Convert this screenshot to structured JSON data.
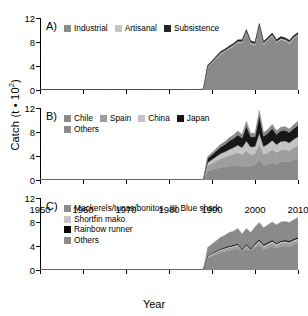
{
  "chart_data": {
    "type": "area",
    "title": "",
    "xlabel": "Year",
    "ylabel": "Catch (t • 10²)",
    "ylabel_base": "Catch (t • 10",
    "ylabel_exp": "2",
    "ylabel_tail": ")",
    "xlim": [
      1950,
      2010
    ],
    "ylim": [
      0,
      12
    ],
    "xticks": [
      1950,
      1960,
      1970,
      1980,
      1990,
      2000,
      2010
    ],
    "yticks": [
      0,
      4,
      8,
      12
    ],
    "grid": false,
    "legend_position": "inside-top-left",
    "stacked": true,
    "x": [
      1950,
      1951,
      1952,
      1953,
      1954,
      1955,
      1956,
      1957,
      1958,
      1959,
      1960,
      1961,
      1962,
      1963,
      1964,
      1965,
      1966,
      1967,
      1968,
      1969,
      1970,
      1971,
      1972,
      1973,
      1974,
      1975,
      1976,
      1977,
      1978,
      1979,
      1980,
      1981,
      1982,
      1983,
      1984,
      1985,
      1986,
      1987,
      1988,
      1989,
      1990,
      1991,
      1992,
      1993,
      1994,
      1995,
      1996,
      1997,
      1998,
      1999,
      2000,
      2001,
      2002,
      2003,
      2004,
      2005,
      2006,
      2007,
      2008,
      2009,
      2010
    ],
    "panels": [
      {
        "id": "A",
        "label": "A)",
        "legend_rows": [
          [
            {
              "name": "Industrial",
              "color": "#8a8a8a"
            },
            {
              "name": "Artisanal",
              "color": "#c4c4c4"
            },
            {
              "name": "Subsistence",
              "color": "#262626"
            }
          ]
        ],
        "series": [
          {
            "name": "Industrial",
            "color": "#8a8a8a",
            "values": [
              0,
              0,
              0,
              0,
              0,
              0,
              0,
              0,
              0,
              0,
              0,
              0,
              0,
              0,
              0,
              0,
              0,
              0,
              0,
              0,
              0,
              0,
              0,
              0,
              0,
              0,
              0,
              0,
              0,
              0,
              0,
              0,
              0,
              0,
              0,
              0,
              0,
              0,
              0.05,
              3.9,
              4.5,
              5.3,
              6.0,
              6.4,
              6.9,
              7.3,
              7.9,
              7.9,
              9.6,
              7.7,
              7.5,
              10.6,
              7.6,
              8.3,
              9.0,
              7.9,
              8.4,
              8.2,
              7.8,
              8.6,
              9.1
            ]
          },
          {
            "name": "Artisanal",
            "color": "#c4c4c4",
            "values": [
              0,
              0,
              0,
              0,
              0,
              0,
              0,
              0,
              0,
              0,
              0,
              0,
              0,
              0,
              0,
              0,
              0,
              0,
              0,
              0,
              0,
              0,
              0,
              0,
              0,
              0,
              0,
              0,
              0.04,
              0.05,
              0.05,
              0.06,
              0.06,
              0.07,
              0.07,
              0.08,
              0.08,
              0.09,
              0.09,
              0.12,
              0.14,
              0.15,
              0.16,
              0.17,
              0.18,
              0.19,
              0.2,
              0.2,
              0.2,
              0.2,
              0.2,
              0.2,
              0.2,
              0.2,
              0.2,
              0.2,
              0.2,
              0.2,
              0.2,
              0.2,
              0.2
            ]
          },
          {
            "name": "Subsistence",
            "color": "#262626",
            "values": [
              0,
              0,
              0,
              0,
              0,
              0,
              0,
              0,
              0,
              0,
              0,
              0,
              0,
              0,
              0,
              0,
              0,
              0,
              0,
              0,
              0,
              0,
              0,
              0,
              0,
              0,
              0,
              0,
              0,
              0,
              0,
              0,
              0,
              0,
              0,
              0,
              0,
              0,
              0,
              0.15,
              0.2,
              0.22,
              0.24,
              0.25,
              0.26,
              0.27,
              0.28,
              0.28,
              0.3,
              0.3,
              0.3,
              0.3,
              0.3,
              0.3,
              0.3,
              0.3,
              0.3,
              0.3,
              0.3,
              0.3,
              0.3
            ]
          }
        ]
      },
      {
        "id": "B",
        "label": "B)",
        "legend_rows": [
          [
            {
              "name": "Chile",
              "color": "#8a8a8a"
            },
            {
              "name": "Spain",
              "color": "#9e9e9e"
            },
            {
              "name": "China",
              "color": "#c4c4c4"
            },
            {
              "name": "Japan",
              "color": "#171717"
            }
          ],
          [
            {
              "name": "Others",
              "color": "#8a8a8a"
            }
          ]
        ],
        "series": [
          {
            "name": "Chile",
            "color": "#8a8a8a",
            "values": [
              0,
              0,
              0,
              0,
              0,
              0,
              0,
              0,
              0,
              0,
              0,
              0,
              0,
              0,
              0,
              0,
              0,
              0,
              0,
              0,
              0,
              0,
              0,
              0,
              0,
              0,
              0,
              0,
              0,
              0,
              0,
              0,
              0,
              0,
              0,
              0,
              0,
              0,
              0.05,
              1.5,
              1.7,
              1.9,
              2.1,
              2.2,
              2.3,
              2.4,
              2.5,
              2.2,
              2.4,
              2.3,
              2.6,
              3.4,
              2.4,
              2.6,
              2.9,
              2.7,
              3.0,
              3.1,
              3.0,
              3.4,
              3.6
            ]
          },
          {
            "name": "Spain",
            "color": "#9e9e9e",
            "values": [
              0,
              0,
              0,
              0,
              0,
              0,
              0,
              0,
              0,
              0,
              0,
              0,
              0,
              0,
              0,
              0,
              0,
              0,
              0,
              0,
              0,
              0,
              0,
              0,
              0,
              0,
              0,
              0,
              0,
              0,
              0,
              0,
              0,
              0,
              0,
              0,
              0,
              0,
              0,
              0.9,
              1.1,
              1.3,
              1.5,
              1.6,
              1.8,
              1.9,
              2.1,
              2.0,
              2.5,
              1.9,
              1.8,
              2.6,
              1.9,
              2.0,
              2.2,
              1.9,
              2.0,
              2.0,
              1.9,
              2.0,
              2.1
            ]
          },
          {
            "name": "China",
            "color": "#c4c4c4",
            "values": [
              0,
              0,
              0,
              0,
              0,
              0,
              0,
              0,
              0,
              0,
              0,
              0,
              0,
              0,
              0,
              0,
              0,
              0,
              0,
              0,
              0,
              0,
              0,
              0,
              0,
              0,
              0,
              0,
              0,
              0,
              0,
              0,
              0,
              0,
              0,
              0,
              0,
              0,
              0,
              0.5,
              0.6,
              0.7,
              0.8,
              0.9,
              1.0,
              1.1,
              1.2,
              1.2,
              1.6,
              1.3,
              1.2,
              1.8,
              1.3,
              1.4,
              1.5,
              1.3,
              1.4,
              1.4,
              1.3,
              1.4,
              1.5
            ]
          },
          {
            "name": "Japan",
            "color": "#171717",
            "values": [
              0,
              0,
              0,
              0,
              0,
              0,
              0,
              0,
              0,
              0,
              0,
              0,
              0,
              0,
              0,
              0,
              0,
              0,
              0,
              0,
              0,
              0,
              0,
              0,
              0,
              0,
              0,
              0,
              0,
              0,
              0,
              0,
              0,
              0,
              0,
              0,
              0,
              0,
              0,
              0.7,
              0.8,
              0.95,
              1.1,
              1.2,
              1.4,
              1.5,
              1.7,
              1.6,
              2.5,
              1.7,
              1.6,
              2.9,
              1.7,
              1.8,
              2.0,
              1.7,
              1.8,
              1.8,
              1.7,
              1.8,
              1.9
            ]
          },
          {
            "name": "Others",
            "color": "#8a8a8a",
            "values": [
              0,
              0,
              0,
              0,
              0,
              0,
              0,
              0,
              0,
              0,
              0,
              0,
              0,
              0,
              0,
              0,
              0,
              0,
              0,
              0,
              0,
              0,
              0,
              0,
              0,
              0,
              0,
              0,
              0,
              0,
              0,
              0,
              0,
              0,
              0,
              0,
              0,
              0,
              0,
              0.3,
              0.35,
              0.4,
              0.45,
              0.5,
              0.55,
              0.6,
              0.65,
              0.6,
              0.8,
              0.6,
              0.6,
              0.9,
              0.6,
              0.6,
              0.7,
              0.6,
              0.6,
              0.6,
              0.6,
              0.6,
              0.7
            ]
          }
        ]
      },
      {
        "id": "C",
        "label": "C)",
        "legend_rows": [
          [
            {
              "name": "Mackerels/tunas/bonitos",
              "color": "#8a8a8a"
            },
            {
              "name": "Blue shark",
              "color": "#9e9e9e"
            }
          ],
          [
            {
              "name": "Shortfin mako",
              "color": "#c4c4c4"
            }
          ],
          [
            {
              "name": "Rainbow runner",
              "color": "#000000"
            }
          ],
          [
            {
              "name": "Others",
              "color": "#8a8a8a"
            }
          ]
        ],
        "series": [
          {
            "name": "Mackerels/tunas/bonitos",
            "color": "#8a8a8a",
            "values": [
              0,
              0,
              0,
              0,
              0,
              0,
              0,
              0,
              0,
              0,
              0,
              0,
              0,
              0,
              0,
              0,
              0,
              0,
              0,
              0,
              0,
              0,
              0,
              0,
              0,
              0,
              0,
              0,
              0,
              0,
              0,
              0,
              0,
              0,
              0,
              0,
              0,
              0,
              0.05,
              2.0,
              2.3,
              2.6,
              2.9,
              3.1,
              3.3,
              3.4,
              3.6,
              3.2,
              3.5,
              3.3,
              3.7,
              4.2,
              3.4,
              3.7,
              4.0,
              3.6,
              3.9,
              4.0,
              3.9,
              4.2,
              4.4
            ]
          },
          {
            "name": "Blue shark",
            "color": "#9e9e9e",
            "values": [
              0,
              0,
              0,
              0,
              0,
              0,
              0,
              0,
              0,
              0,
              0,
              0,
              0,
              0,
              0,
              0,
              0,
              0,
              0,
              0,
              0,
              0,
              0,
              0,
              0,
              0,
              0,
              0,
              0,
              0,
              0,
              0,
              0,
              0,
              0,
              0,
              0,
              0,
              0,
              0.25,
              0.3,
              0.32,
              0.35,
              0.37,
              0.4,
              0.42,
              0.45,
              0.1,
              0.45,
              0.1,
              0.42,
              0.5,
              0.45,
              0.5,
              0.55,
              0.5,
              0.55,
              0.55,
              0.5,
              0.55,
              0.6
            ]
          },
          {
            "name": "Shortfin mako",
            "color": "#c4c4c4",
            "values": [
              0,
              0,
              0,
              0,
              0,
              0,
              0,
              0,
              0,
              0,
              0,
              0,
              0,
              0,
              0,
              0,
              0,
              0,
              0,
              0,
              0,
              0,
              0,
              0,
              0,
              0,
              0,
              0,
              0,
              0,
              0,
              0,
              0,
              0,
              0,
              0,
              0,
              0,
              0,
              0.12,
              0.14,
              0.15,
              0.16,
              0.17,
              0.18,
              0.19,
              0.2,
              0.05,
              0.2,
              0.05,
              0.18,
              0.22,
              0.2,
              0.22,
              0.24,
              0.22,
              0.24,
              0.24,
              0.22,
              0.24,
              0.26
            ]
          },
          {
            "name": "Rainbow runner",
            "color": "#000000",
            "values": [
              0,
              0,
              0,
              0,
              0,
              0,
              0,
              0,
              0,
              0,
              0,
              0,
              0,
              0,
              0,
              0,
              0,
              0,
              0,
              0,
              0,
              0,
              0,
              0,
              0,
              0,
              0,
              0,
              0,
              0,
              0,
              0,
              0,
              0,
              0,
              0,
              0,
              0,
              0,
              0.1,
              0.11,
              0.12,
              0.13,
              0.14,
              0.15,
              0.16,
              0.17,
              0.17,
              0.18,
              0.18,
              0.18,
              0.19,
              0.19,
              0.2,
              0.2,
              0.2,
              0.2,
              0.2,
              0.2,
              0.2,
              0.2
            ]
          },
          {
            "name": "Others",
            "color": "#8a8a8a",
            "values": [
              0,
              0,
              0,
              0,
              0,
              0,
              0,
              0,
              0,
              0,
              0,
              0,
              0,
              0,
              0,
              0,
              0,
              0,
              0,
              0,
              0,
              0,
              0,
              0,
              0,
              0,
              0,
              0,
              0,
              0,
              0,
              0,
              0,
              0,
              0,
              0,
              0,
              0,
              0,
              1.3,
              1.5,
              1.7,
              1.9,
              2.0,
              2.2,
              2.3,
              2.5,
              2.5,
              2.6,
              2.6,
              2.7,
              2.8,
              2.8,
              2.9,
              3.0,
              3.0,
              3.1,
              3.1,
              3.1,
              3.2,
              3.3
            ]
          }
        ]
      }
    ]
  }
}
